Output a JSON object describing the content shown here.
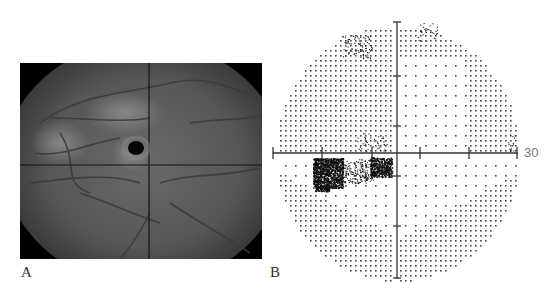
{
  "figure": {
    "panels": [
      {
        "label": "A",
        "kind": "fundus-photograph"
      },
      {
        "label": "B",
        "kind": "visual-field-dot-plot"
      }
    ]
  },
  "fundus": {
    "crosshair": {
      "x_frac": 0.533,
      "y_frac": 0.52
    },
    "lesion": {
      "x_frac": 0.48,
      "y_frac": 0.435,
      "r": 7
    }
  },
  "visual_field": {
    "axis_label": "30",
    "center": {
      "x": 132,
      "y": 143
    },
    "radius_x": 122,
    "radius_y": 128,
    "ticks_x": [
      -124,
      -75,
      -25,
      23,
      72,
      120
    ],
    "ticks_y": [
      -131,
      -77,
      -27,
      23,
      73,
      125
    ],
    "colors": {
      "dot": "#444444",
      "axis": "#333333",
      "scotoma": "#111111"
    }
  }
}
